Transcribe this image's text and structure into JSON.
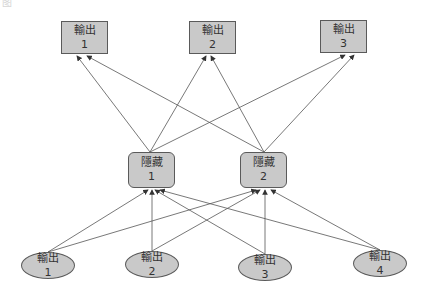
{
  "caption": "图",
  "colors": {
    "node_fill": "#c9c9c9",
    "node_border": "#5a5a5a",
    "edge": "#555555",
    "text": "#333333"
  },
  "layers": {
    "output": [
      {
        "label": "輸出",
        "index": "1"
      },
      {
        "label": "輸出",
        "index": "2"
      },
      {
        "label": "輸出",
        "index": "3"
      }
    ],
    "hidden": [
      {
        "label": "隱藏",
        "index": "1"
      },
      {
        "label": "隱藏",
        "index": "2"
      }
    ],
    "input": [
      {
        "label": "輸出",
        "index": "1"
      },
      {
        "label": "輸出",
        "index": "2"
      },
      {
        "label": "輸出",
        "index": "3"
      },
      {
        "label": "輸出",
        "index": "4"
      }
    ]
  },
  "edges": [
    {
      "from": "input-1",
      "to": "hidden-1"
    },
    {
      "from": "input-1",
      "to": "hidden-2"
    },
    {
      "from": "input-2",
      "to": "hidden-1"
    },
    {
      "from": "input-2",
      "to": "hidden-2"
    },
    {
      "from": "input-3",
      "to": "hidden-1"
    },
    {
      "from": "input-3",
      "to": "hidden-2"
    },
    {
      "from": "input-4",
      "to": "hidden-1"
    },
    {
      "from": "input-4",
      "to": "hidden-2"
    },
    {
      "from": "hidden-1",
      "to": "output-1"
    },
    {
      "from": "hidden-1",
      "to": "output-2"
    },
    {
      "from": "hidden-1",
      "to": "output-3"
    },
    {
      "from": "hidden-2",
      "to": "output-1"
    },
    {
      "from": "hidden-2",
      "to": "output-2"
    },
    {
      "from": "hidden-2",
      "to": "output-3"
    }
  ]
}
